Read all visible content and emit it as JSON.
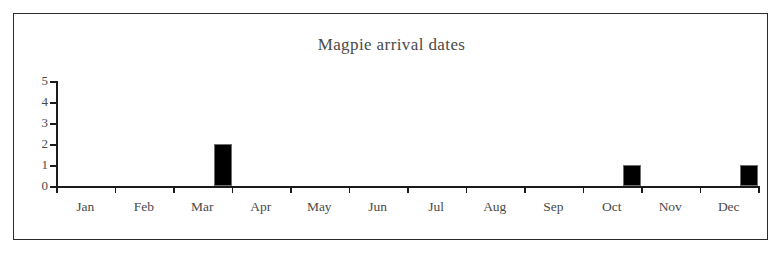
{
  "chart_data": {
    "type": "bar",
    "title": "Magpie arrival dates",
    "xlabel": "",
    "ylabel": "",
    "categories": [
      "Jan",
      "Feb",
      "Mar",
      "Apr",
      "May",
      "Jun",
      "Jul",
      "Aug",
      "Sep",
      "Oct",
      "Nov",
      "Dec"
    ],
    "values": [
      0,
      0,
      2,
      0,
      0,
      0,
      0,
      0,
      0,
      1,
      0,
      1
    ],
    "ylim": [
      0,
      5
    ],
    "yticks": [
      "0",
      "1",
      "2",
      "3",
      "4",
      "5"
    ],
    "grid": false,
    "legend": false,
    "bar_color": "#000000",
    "axis_color": "#1a1a1a",
    "text_color": "#4a4a4a",
    "frame_color": "#2b2b2b",
    "background": "#ffffff"
  }
}
